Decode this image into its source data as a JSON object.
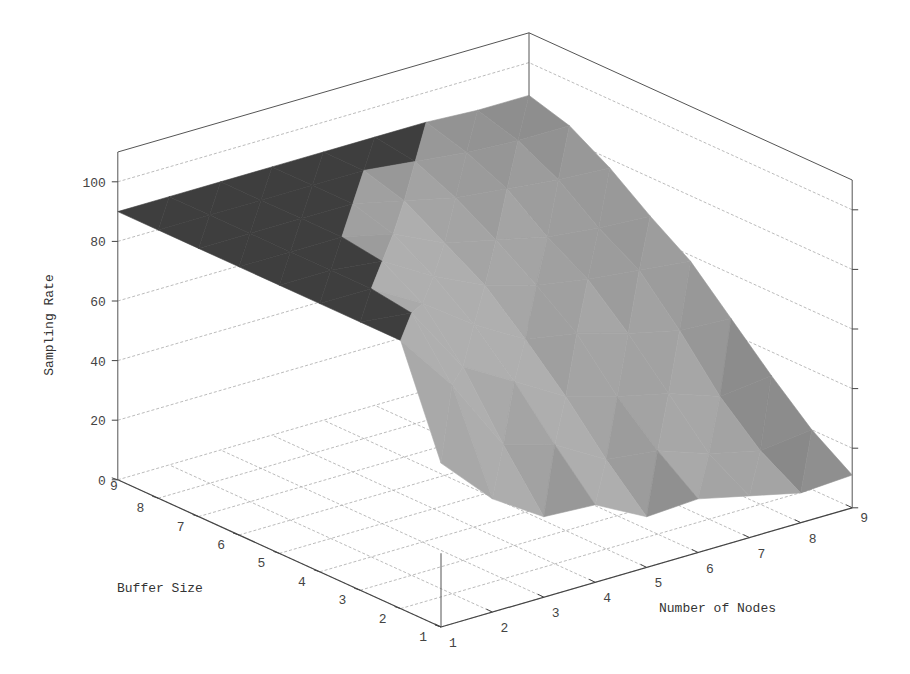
{
  "chart_data": {
    "type": "surface3d",
    "title": "",
    "xlabel": "Number of Nodes",
    "ylabel": "Buffer Size",
    "zlabel": "Sampling Rate",
    "x_ticks": [
      1,
      2,
      3,
      4,
      5,
      6,
      7,
      8,
      9
    ],
    "y_ticks": [
      1,
      2,
      3,
      4,
      5,
      6,
      7,
      8,
      9
    ],
    "z_ticks": [
      0,
      20,
      40,
      60,
      80,
      100
    ],
    "zlim": [
      0,
      110
    ],
    "grid": true,
    "colormap": "grayscale-shaded",
    "x": [
      1,
      2,
      3,
      4,
      5,
      6,
      7,
      8,
      9
    ],
    "y": [
      1,
      2,
      3,
      4,
      5,
      6,
      7,
      8,
      9
    ],
    "z_rows_by_buffer": [
      [
        55,
        38,
        27,
        26,
        17,
        18,
        14,
        10,
        11
      ],
      [
        90,
        70,
        45,
        40,
        30,
        28,
        22,
        18,
        20
      ],
      [
        90,
        88,
        65,
        55,
        45,
        40,
        36,
        30,
        32
      ],
      [
        90,
        90,
        80,
        68,
        58,
        55,
        50,
        46,
        45
      ],
      [
        90,
        90,
        88,
        78,
        70,
        65,
        62,
        60,
        58
      ],
      [
        90,
        90,
        90,
        86,
        78,
        74,
        70,
        68,
        67
      ],
      [
        90,
        90,
        90,
        90,
        86,
        82,
        80,
        78,
        77
      ],
      [
        90,
        90,
        90,
        90,
        90,
        88,
        86,
        85,
        85
      ],
      [
        90,
        90,
        90,
        90,
        90,
        90,
        90,
        89,
        89
      ]
    ]
  },
  "axes": {
    "z_label": "Sampling Rate",
    "buffer_label": "Buffer Size",
    "nodes_label": "Number of Nodes",
    "z_tick_labels": [
      "0",
      "20",
      "40",
      "60",
      "80",
      "100"
    ],
    "buffer_tick_labels": [
      "1",
      "2",
      "3",
      "4",
      "5",
      "6",
      "7",
      "8",
      "9"
    ],
    "nodes_tick_labels": [
      "1",
      "2",
      "3",
      "4",
      "5",
      "6",
      "7",
      "8",
      "9"
    ]
  }
}
